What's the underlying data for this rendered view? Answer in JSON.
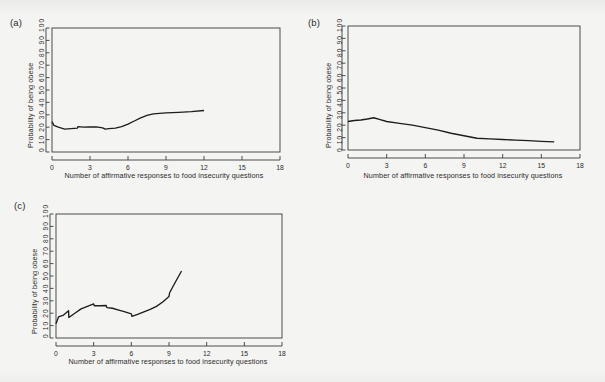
{
  "figure": {
    "background_color": "#f4f4f2",
    "line_color": "#1d1d1d",
    "axis_color": "#3a3a3a"
  },
  "panels": [
    {
      "label": "(a)",
      "ylabel": "Probability of being obese",
      "xlabel": "Number of affirmative responses to food insecurity questions",
      "yticks": "0  10 20 30 40 50 60 70 80 90 100",
      "ytick_values": [
        0,
        10,
        20,
        30,
        40,
        50,
        60,
        70,
        80,
        90,
        100
      ],
      "xtick_values": [
        0,
        3,
        6,
        9,
        12,
        15,
        18
      ]
    },
    {
      "label": "(b)",
      "ylabel": "Probability of being obese",
      "xlabel": "Number of affirmative responses to food insecurity questions",
      "yticks": "0  10 20 30 40 50 60 70 80 90 100",
      "ytick_values": [
        0,
        10,
        20,
        30,
        40,
        50,
        60,
        70,
        80,
        90,
        100
      ],
      "xtick_values": [
        0,
        3,
        6,
        9,
        12,
        15,
        18
      ]
    },
    {
      "label": "(c)",
      "ylabel": "Probability of being obese",
      "xlabel": "Number of affirmative responses to food insecurity questions",
      "yticks": "0  10 20 30 40 50 60 70 80 90 100",
      "ytick_values": [
        0,
        10,
        20,
        30,
        40,
        50,
        60,
        70,
        80,
        90,
        100
      ],
      "xtick_values": [
        0,
        3,
        6,
        9,
        12,
        15,
        18
      ]
    }
  ],
  "chart_data": [
    {
      "type": "line",
      "panel": "(a)",
      "title": "",
      "xlabel": "Number of affirmative responses to food insecurity questions",
      "ylabel": "Probability of being obese",
      "xlim": [
        0,
        18
      ],
      "ylim": [
        0,
        100
      ],
      "xticks": [
        0,
        3,
        6,
        9,
        12,
        15,
        18
      ],
      "yticks": [
        0,
        10,
        20,
        30,
        40,
        50,
        60,
        70,
        80,
        90,
        100
      ],
      "grid": false,
      "legend": "none",
      "series": [
        {
          "name": "probability of being obese",
          "x": [
            0,
            0.15,
            0.5,
            1,
            1.5,
            2,
            2.05,
            2.5,
            3,
            3.5,
            4,
            4.2,
            4.5,
            5,
            5.5,
            6,
            6.5,
            7,
            7.5,
            8,
            8.5,
            9,
            10,
            11,
            12
          ],
          "y": [
            24.5,
            21.5,
            20.0,
            18.5,
            18.8,
            19.2,
            20.5,
            20.0,
            20.2,
            20.2,
            19.5,
            18.5,
            18.8,
            19.2,
            20.5,
            22.5,
            25.0,
            27.5,
            29.5,
            30.8,
            31.2,
            31.5,
            32.0,
            32.6,
            33.5
          ]
        }
      ]
    },
    {
      "type": "line",
      "panel": "(b)",
      "title": "",
      "xlabel": "Number of affirmative responses to food insecurity questions",
      "ylabel": "Probability of being obese",
      "xlim": [
        0,
        18
      ],
      "ylim": [
        0,
        100
      ],
      "xticks": [
        0,
        3,
        6,
        9,
        12,
        15,
        18
      ],
      "yticks": [
        0,
        10,
        20,
        30,
        40,
        50,
        60,
        70,
        80,
        90,
        100
      ],
      "grid": false,
      "legend": "none",
      "series": [
        {
          "name": "probability of being obese",
          "x": [
            0,
            0.5,
            1,
            1.5,
            2,
            2.5,
            3,
            4,
            5,
            6,
            7,
            8,
            9,
            10,
            11,
            12,
            13,
            14,
            15,
            16
          ],
          "y": [
            23.0,
            23.8,
            24.2,
            25.0,
            26.0,
            24.5,
            23.0,
            21.5,
            20.0,
            18.0,
            16.0,
            13.5,
            11.5,
            9.5,
            9.0,
            8.5,
            8.0,
            7.5,
            7.0,
            6.5
          ]
        }
      ]
    },
    {
      "type": "line",
      "panel": "(c)",
      "title": "",
      "xlabel": "Number of affirmative responses to food insecurity questions",
      "ylabel": "Probability of being obese",
      "xlim": [
        0,
        18
      ],
      "ylim": [
        0,
        100
      ],
      "xticks": [
        0,
        3,
        6,
        9,
        12,
        15,
        18
      ],
      "yticks": [
        0,
        10,
        20,
        30,
        40,
        50,
        60,
        70,
        80,
        90,
        100
      ],
      "grid": false,
      "legend": "none",
      "series": [
        {
          "name": "probability of being obese",
          "x": [
            0,
            0.2,
            0.6,
            1,
            1.02,
            1.5,
            2,
            2.5,
            3,
            3.05,
            3.5,
            4,
            4.05,
            4.5,
            5,
            5.5,
            6,
            6.05,
            6.5,
            7,
            7.5,
            8,
            8.5,
            9,
            9.05,
            9.5,
            10
          ],
          "y": [
            11.5,
            17.0,
            18.5,
            22.0,
            16.5,
            20.0,
            23.5,
            25.5,
            27.5,
            26.0,
            26.0,
            26.2,
            24.5,
            24.0,
            22.5,
            21.0,
            19.5,
            17.5,
            19.0,
            21.0,
            23.0,
            25.5,
            29.0,
            33.5,
            36.5,
            45.0,
            54.0
          ]
        }
      ]
    }
  ]
}
